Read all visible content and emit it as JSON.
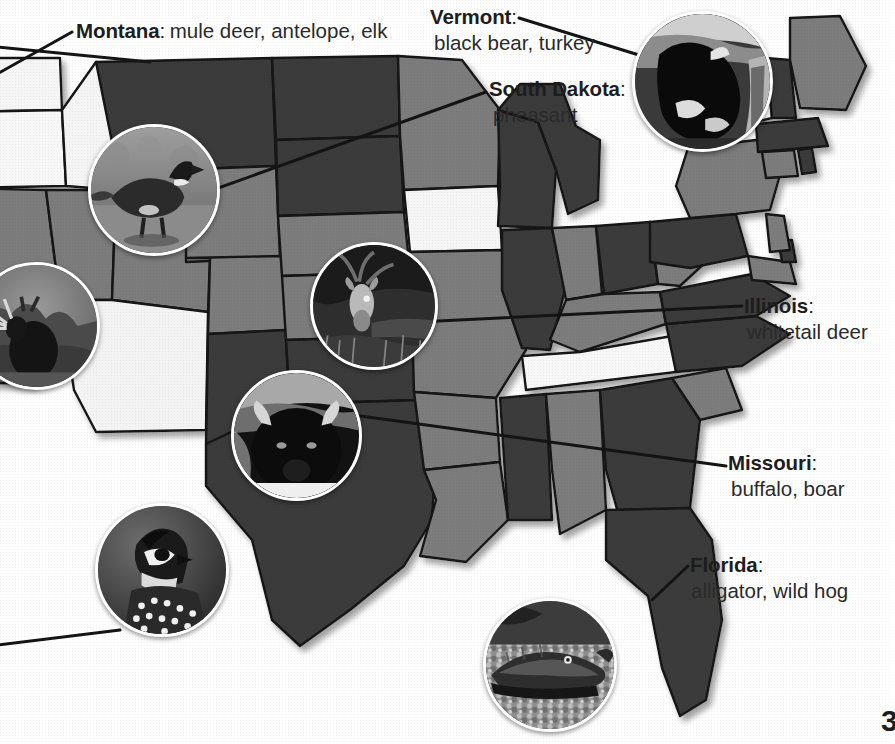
{
  "page": {
    "kind": "illustrated-map",
    "page_number": "3",
    "background_color": "#ffffff"
  },
  "map": {
    "name": "united-states-map",
    "palette": {
      "dark": "#3b3b3b",
      "mid": "#7b7b7b",
      "light": "#f2f2f2",
      "white": "#ffffff",
      "outline": "#111111",
      "shadow": "#9a9a9a"
    }
  },
  "callouts": [
    {
      "id": "montana",
      "state": "Montana",
      "colon": ":",
      "animals": "mule deer, antelope, elk",
      "lines": 1
    },
    {
      "id": "vermont",
      "state": "Vermont",
      "colon": ":",
      "animals": "black bear, turkey",
      "lines": 2
    },
    {
      "id": "south-dakota",
      "state": "South Dakota",
      "colon": ":",
      "animals": "pheasant",
      "lines": 2
    },
    {
      "id": "illinois",
      "state": "Illinois",
      "colon": ":",
      "animals": "whitetail deer",
      "lines": 2
    },
    {
      "id": "missouri",
      "state": "Missouri",
      "colon": ":",
      "animals": "buffalo, boar",
      "lines": 2
    },
    {
      "id": "florida",
      "state": "Florida",
      "colon": ":",
      "animals": "alligator, wild hog",
      "lines": 2
    }
  ],
  "photos": [
    {
      "id": "elk",
      "subject": "elk-photo",
      "alt": "elk standing in brush"
    },
    {
      "id": "pheasant",
      "subject": "pheasant-photo",
      "alt": "pheasant walking on ground"
    },
    {
      "id": "deer",
      "subject": "deer-photo",
      "alt": "whitetail deer in tall grass"
    },
    {
      "id": "bison",
      "subject": "buffalo-photo",
      "alt": "buffalo head facing camera"
    },
    {
      "id": "quail",
      "subject": "quail-photo",
      "alt": "quail head close up"
    },
    {
      "id": "bear",
      "subject": "black-bear-photo",
      "alt": "black bear in woods"
    },
    {
      "id": "gator",
      "subject": "alligator-photo",
      "alt": "alligator resting on gravel"
    }
  ]
}
